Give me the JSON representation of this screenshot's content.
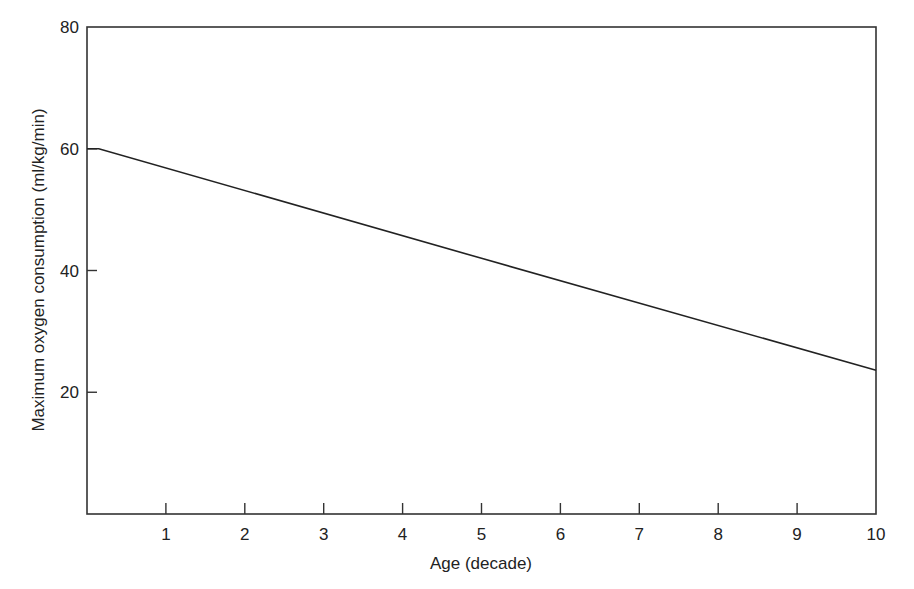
{
  "chart_data": {
    "type": "line",
    "title": "",
    "xlabel": "Age (decade)",
    "ylabel": "Maximum oxygen consumption (ml/kg/min)",
    "xlim": [
      0,
      10
    ],
    "ylim": [
      0,
      80
    ],
    "x_ticks": [
      1,
      2,
      3,
      4,
      5,
      6,
      7,
      8,
      9,
      10
    ],
    "y_ticks": [
      20,
      40,
      60,
      80
    ],
    "grid": false,
    "legend": null,
    "series": [
      {
        "name": "VO2 max",
        "color": "#222222",
        "points": [
          [
            0,
            60
          ],
          [
            0.15,
            60
          ],
          [
            5,
            42
          ],
          [
            10,
            23.6
          ]
        ]
      }
    ]
  }
}
